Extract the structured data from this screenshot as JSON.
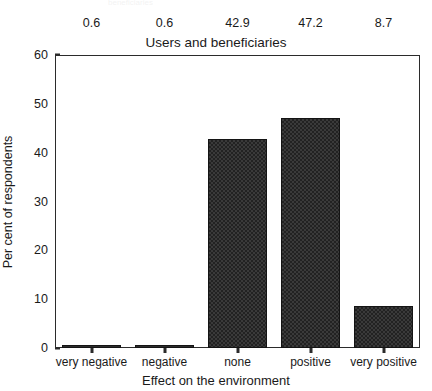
{
  "chart_data": {
    "type": "bar",
    "title": "Users and beneficiaries",
    "xlabel": "Effect on the environment",
    "ylabel": "Per cent of respondents",
    "categories": [
      "very negative",
      "negative",
      "none",
      "positive",
      "very positive"
    ],
    "values": [
      0.6,
      0.6,
      42.9,
      47.2,
      8.7
    ],
    "value_labels": [
      "0.6",
      "0.6",
      "42.9",
      "47.2",
      "8.7"
    ],
    "ylim": [
      0,
      60
    ],
    "yticks": [
      0,
      10,
      20,
      30,
      40,
      50,
      60
    ],
    "ytick_labels": [
      "0",
      "10",
      "20",
      "30",
      "40",
      "50",
      "60"
    ],
    "grid": false,
    "legend": false,
    "legend_position": "none",
    "bar_color": "#3a3a3a",
    "bar_edge_color": "#141414",
    "axis_color": "#2b2b2b",
    "background_color": "#ffffff",
    "value_labels_position": "above-title"
  },
  "artifacts": {
    "top_cropped_text": "beneficiaries"
  }
}
